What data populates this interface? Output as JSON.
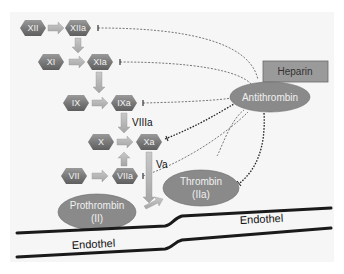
{
  "colors": {
    "hexagon_fill": "#7f7f7f",
    "hexagon_dark": "#5e5e5e",
    "ellipse_fill": "#8a8a8a",
    "arrow_fill": "#b5b5b5",
    "heparin_fill": "#9a9a9a",
    "endothelium_line": "#1a1a1a",
    "inhibition_line": "#444444"
  },
  "factors": [
    {
      "id": "XII",
      "label": "XII"
    },
    {
      "id": "XIIa",
      "label": "XIIa"
    },
    {
      "id": "XI",
      "label": "XI"
    },
    {
      "id": "XIa",
      "label": "XIa"
    },
    {
      "id": "IX",
      "label": "IX"
    },
    {
      "id": "IXa",
      "label": "IXa"
    },
    {
      "id": "X",
      "label": "X"
    },
    {
      "id": "Xa",
      "label": "Xa"
    },
    {
      "id": "VII",
      "label": "VII"
    },
    {
      "id": "VIIa",
      "label": "VIIa"
    }
  ],
  "cofactors": {
    "viiia": "VIIIa",
    "va": "Va"
  },
  "ellipses": {
    "antithrombin": "Antithrombin",
    "prothrombin_line1": "Prothrombin",
    "prothrombin_line2": "(II)",
    "thrombin_line1": "Thrombin",
    "thrombin_line2": "(IIa)"
  },
  "heparin": "Heparin",
  "endothelium": {
    "upper": "Endothel",
    "lower": "Endothel"
  }
}
